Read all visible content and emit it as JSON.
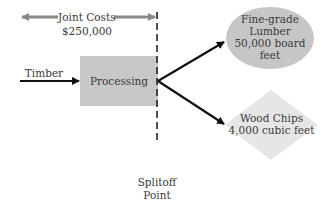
{
  "diagram": {
    "joint_costs": {
      "label": "Joint Costs",
      "amount": "$250,000"
    },
    "input": {
      "label": "Timber"
    },
    "process": {
      "label": "Processing"
    },
    "splitoff": {
      "line1": "Splitoff",
      "line2": "Point"
    },
    "products": [
      {
        "shape": "ellipse",
        "line1": "Fine-grade",
        "line2": "Lumber",
        "line3": "50,000 board",
        "line4": "feet"
      },
      {
        "shape": "diamond",
        "line1": "Wood Chips",
        "line2": "4,000 cubic feet"
      }
    ],
    "colors": {
      "process_fill": "#c8c8c8",
      "ellipse_fill": "#c6c6c6",
      "diamond_fill": "#e6e6e6",
      "joint_arrow": "#8a8a8a",
      "arrow": "#111111"
    }
  }
}
